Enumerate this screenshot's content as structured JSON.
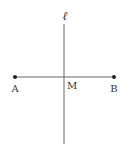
{
  "diagram": {
    "line_label": "ℓ",
    "points": {
      "A": {
        "label": "A",
        "x": 15,
        "y": 77
      },
      "B": {
        "label": "B",
        "x": 114,
        "y": 77
      },
      "M": {
        "label": "M"
      }
    },
    "colors": {
      "stroke": "#555555",
      "point": "#222222",
      "text": "#333333"
    }
  }
}
